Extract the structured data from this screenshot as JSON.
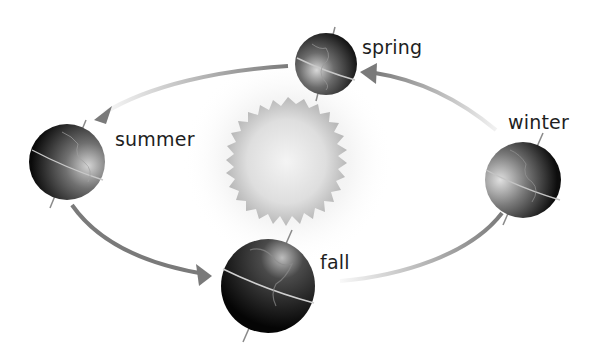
{
  "diagram": {
    "title": "",
    "type": "seasons-orbit",
    "central_body": {
      "name": "sun",
      "cx": 288,
      "cy": 161,
      "r": 60
    },
    "globes": [
      {
        "id": "spring",
        "label": "spring",
        "cx": 326,
        "cy": 64,
        "r": 31,
        "label_x": 362,
        "label_y": 36
      },
      {
        "id": "summer",
        "label": "summer",
        "cx": 67,
        "cy": 162,
        "r": 38,
        "label_x": 115,
        "label_y": 128
      },
      {
        "id": "fall",
        "label": "fall",
        "cx": 268,
        "cy": 286,
        "r": 47,
        "label_x": 320,
        "label_y": 251
      },
      {
        "id": "winter",
        "label": "winter",
        "cx": 523,
        "cy": 180,
        "r": 38,
        "label_x": 508,
        "label_y": 111
      }
    ],
    "arrows": [
      {
        "from": "spring",
        "to": "summer"
      },
      {
        "from": "summer",
        "to": "fall"
      },
      {
        "from": "fall",
        "to": "winter"
      },
      {
        "from": "winter",
        "to": "spring"
      }
    ],
    "colors": {
      "arrow": "#7a7a7a",
      "label": "#1e1e1e",
      "sun_core": "#f0f0f0",
      "sun_edge": "#bdbdbd",
      "globe_dark": "#111111",
      "globe_light": "#cfcfcf"
    }
  }
}
